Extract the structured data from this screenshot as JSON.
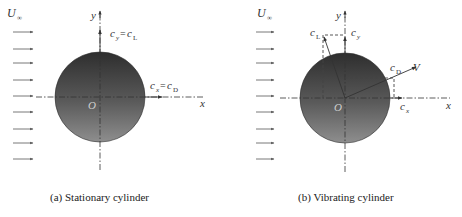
{
  "figure": {
    "panels": [
      {
        "id": "a",
        "caption": "(a) Stationary cylinder",
        "freestream_label": "U",
        "freestream_sub": "∞",
        "y_axis_label": "y",
        "x_axis_label": "x",
        "origin_label": "O",
        "lift_label": {
          "main": "c",
          "sub1": "y",
          "eq": "=",
          "main2": "c",
          "sub2": "L"
        },
        "drag_label": {
          "main": "c",
          "sub1": "x",
          "eq": "=",
          "main2": "c",
          "sub2": "D"
        }
      },
      {
        "id": "b",
        "caption": "(b) Vibrating cylinder",
        "freestream_label": "U",
        "freestream_sub": "∞",
        "y_axis_label": "y",
        "x_axis_label": "x",
        "origin_label": "O",
        "cL_label": {
          "main": "c",
          "sub": "L"
        },
        "cy_label": {
          "main": "c",
          "sub": "y"
        },
        "cD_label": {
          "main": "c",
          "sub": "D"
        },
        "cx_label": {
          "main": "c",
          "sub": "x"
        },
        "velocity_label": "V"
      }
    ],
    "colors": {
      "cylinder_top": "#3a3a3a",
      "cylinder_bottom": "#8a8a8a",
      "lines": "#333333",
      "background": "#ffffff"
    }
  }
}
